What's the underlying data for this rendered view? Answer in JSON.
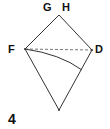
{
  "diagram": {
    "type": "folding-step",
    "step_number": "4",
    "labels": {
      "g": "G",
      "h": "H",
      "f": "F",
      "d": "D"
    },
    "points": {
      "top": [
        59,
        15
      ],
      "f": [
        25,
        49
      ],
      "d": [
        92,
        50
      ],
      "bottom": [
        59,
        110
      ],
      "curve_end": [
        82,
        70
      ]
    },
    "lines": [
      {
        "from": "top",
        "to": "f",
        "style": "solid"
      },
      {
        "from": "top",
        "to": "d",
        "style": "solid"
      },
      {
        "from": "f",
        "to": "bottom",
        "style": "solid"
      },
      {
        "from": "d",
        "to": "bottom",
        "style": "solid"
      },
      {
        "from": "f",
        "to": "d",
        "style": "dashed"
      },
      {
        "from": "f",
        "to": "curve_end",
        "style": "curved"
      }
    ],
    "colors": {
      "stroke": "#333333",
      "dashed": "#777777",
      "background": "#ffffff"
    }
  }
}
